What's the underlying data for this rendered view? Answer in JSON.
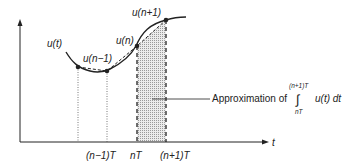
{
  "diagram": {
    "axis": {
      "x_label": "t",
      "ticks": [
        {
          "label": "(n−1)T",
          "x": 107
        },
        {
          "label": "nT",
          "x": 137
        },
        {
          "label": "(n+1)T",
          "x": 166
        }
      ]
    },
    "curve_label": "u(t)",
    "points": [
      {
        "label": "u(n−1)",
        "x": 107,
        "y": 71
      },
      {
        "label": "u(n)",
        "x": 137,
        "y": 46
      },
      {
        "label": "u(n+1)",
        "x": 166,
        "y": 20
      }
    ],
    "extra_point": {
      "x": 78,
      "y": 67
    },
    "annotation": {
      "text": "Approximation of",
      "integral_upper": "(n+1)T",
      "integral_lower": "nT",
      "integral_symbol": "∫",
      "integrand": "u(t) dt"
    },
    "colors": {
      "line": "#222222",
      "shade": "#d9d9d9"
    }
  }
}
